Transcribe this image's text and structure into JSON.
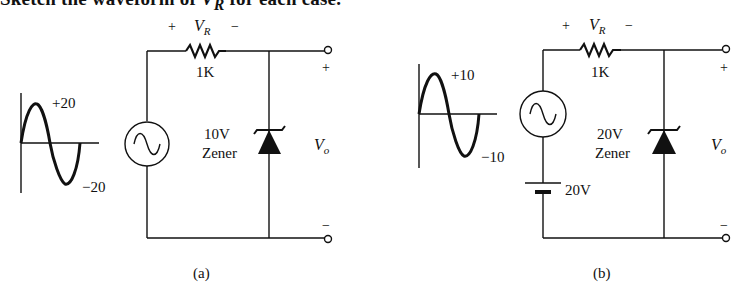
{
  "heading": {
    "prefix": "Sketch the waveform of ",
    "var": "V",
    "sub": "R",
    "suffix": " for each case."
  },
  "circuits": [
    {
      "id": "a",
      "caption": "(a)",
      "input_peak_pos": "+20",
      "input_peak_neg": "−20",
      "resistor_label": "1K",
      "vr_plus": "+",
      "vr_label": "V",
      "vr_sub": "R",
      "vr_minus": "−",
      "zener_value": "10V",
      "zener_label": "Zener",
      "out_plus": "+",
      "out_minus": "−",
      "vo_label": "V",
      "vo_sub": "o"
    },
    {
      "id": "b",
      "caption": "(b)",
      "input_peak_pos": "+10",
      "input_peak_neg": "−10",
      "resistor_label": "1K",
      "vr_plus": "+",
      "vr_label": "V",
      "vr_sub": "R",
      "vr_minus": "−",
      "zener_value": "20V",
      "zener_label": "Zener",
      "battery_label": "20V",
      "out_plus": "+",
      "out_minus": "−",
      "vo_label": "V",
      "vo_sub": "o"
    }
  ]
}
